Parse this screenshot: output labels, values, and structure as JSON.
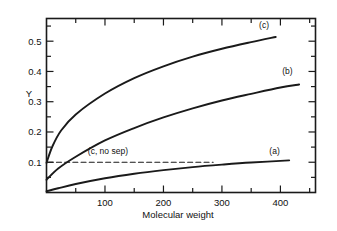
{
  "chart_data": {
    "type": "line",
    "title": "",
    "xlabel": "Molecular weight",
    "ylabel": "Y",
    "xlim": [
      0,
      460
    ],
    "ylim": [
      0,
      0.575
    ],
    "grid": false,
    "legend_position": "inline-end-of-curve",
    "x_ticks_major": [
      100,
      200,
      300,
      400
    ],
    "x_tick_labels": [
      "100",
      "200",
      "300",
      "400"
    ],
    "x_ticks_minor": [
      50,
      150,
      250,
      350,
      450
    ],
    "y_ticks_major": [
      0.1,
      0.2,
      0.3,
      0.4,
      0.5
    ],
    "y_tick_labels": [
      "0.1",
      "0.2",
      "0.3",
      "0.4",
      "0.5"
    ],
    "y_ticks_minor": [
      0.05,
      0.15,
      0.25,
      0.35,
      0.45,
      0.55
    ],
    "series": [
      {
        "name": "(a)",
        "label": "(a)",
        "style": "solid",
        "label_x": 390,
        "label_y": 0.128,
        "x": [
          0,
          20,
          50,
          100,
          150,
          200,
          250,
          300,
          350,
          415
        ],
        "values": [
          0.004,
          0.014,
          0.028,
          0.047,
          0.062,
          0.074,
          0.084,
          0.092,
          0.099,
          0.106
        ]
      },
      {
        "name": "(b)",
        "label": "(b)",
        "style": "solid",
        "label_x": 412,
        "label_y": 0.392,
        "x": [
          0,
          20,
          50,
          100,
          150,
          200,
          250,
          300,
          350,
          400,
          432
        ],
        "values": [
          0.042,
          0.079,
          0.118,
          0.172,
          0.213,
          0.248,
          0.278,
          0.304,
          0.326,
          0.347,
          0.357
        ]
      },
      {
        "name": "(c)",
        "label": "(c)",
        "style": "solid",
        "label_x": 372,
        "label_y": 0.545,
        "x": [
          0,
          10,
          25,
          50,
          100,
          150,
          200,
          250,
          300,
          350,
          392
        ],
        "values": [
          0.098,
          0.152,
          0.205,
          0.258,
          0.327,
          0.378,
          0.417,
          0.449,
          0.475,
          0.497,
          0.514
        ]
      },
      {
        "name": "(c, no sep)",
        "label": "(c, no sep)",
        "style": "dashed",
        "label_x": 105,
        "label_y": 0.128,
        "x": [
          3,
          285
        ],
        "values": [
          0.1,
          0.1
        ]
      }
    ]
  },
  "figure": {
    "y_axis_title": "Y",
    "x_axis_title": "Molecular weight",
    "frame_color": "#1a1a1a",
    "curve_color": "#1a1a1a",
    "background": "#ffffff"
  }
}
